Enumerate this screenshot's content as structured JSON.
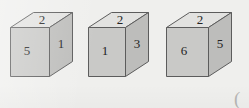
{
  "figure": {
    "background_color": "#efefed",
    "edge_color": "#5c5c5c",
    "top_face_color": "#e2e2e0",
    "left_face_color": "#c9c9c7",
    "right_face_color": "#bdbdbb",
    "label_color": "#242424",
    "cubes": [
      {
        "name": "cube-1",
        "top": "2",
        "left": "5",
        "right": "1"
      },
      {
        "name": "cube-2",
        "top": "2",
        "left": "1",
        "right": "3"
      },
      {
        "name": "cube-3",
        "top": "2",
        "left": "6",
        "right": "5"
      }
    ],
    "corner_mark": "("
  }
}
